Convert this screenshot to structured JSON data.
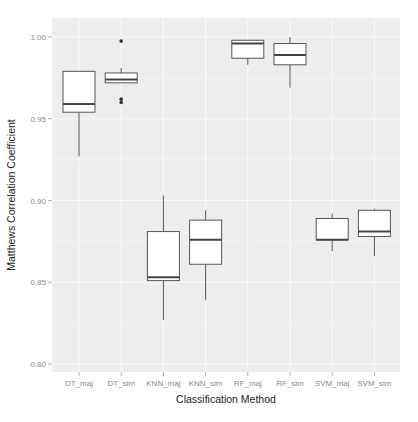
{
  "chart_data": {
    "type": "boxplot",
    "title": "",
    "xlabel": "Classification Method",
    "ylabel": "Matthews Correlation Coefficient",
    "ylim": [
      0.79,
      1.011
    ],
    "yticks": [
      0.8,
      0.85,
      0.9,
      0.95,
      1.0
    ],
    "ytick_labels": [
      "0.80",
      "0.85",
      "0.90",
      "0.95",
      "1.00"
    ],
    "grid": true,
    "legend": null,
    "categories": [
      "DT_maj",
      "DT_sim",
      "KNN_maj",
      "KNN_sim",
      "RF_maj",
      "RF_sim",
      "SVM_maj",
      "SVM_sim"
    ],
    "boxes": [
      {
        "name": "DT_maj",
        "whisker_low": 0.927,
        "q1": 0.954,
        "median": 0.959,
        "q3": 0.979,
        "whisker_high": 0.979,
        "outliers": []
      },
      {
        "name": "DT_sim",
        "whisker_low": 0.972,
        "q1": 0.972,
        "median": 0.974,
        "q3": 0.978,
        "whisker_high": 0.981,
        "outliers": [
          0.9975,
          0.962,
          0.96
        ]
      },
      {
        "name": "KNN_maj",
        "whisker_low": 0.827,
        "q1": 0.851,
        "median": 0.853,
        "q3": 0.881,
        "whisker_high": 0.903,
        "outliers": []
      },
      {
        "name": "KNN_sim",
        "whisker_low": 0.839,
        "q1": 0.861,
        "median": 0.876,
        "q3": 0.888,
        "whisker_high": 0.894,
        "outliers": []
      },
      {
        "name": "RF_maj",
        "whisker_low": 0.983,
        "q1": 0.987,
        "median": 0.996,
        "q3": 0.998,
        "whisker_high": 0.998,
        "outliers": []
      },
      {
        "name": "RF_sim",
        "whisker_low": 0.969,
        "q1": 0.983,
        "median": 0.989,
        "q3": 0.996,
        "whisker_high": 1.0,
        "outliers": []
      },
      {
        "name": "SVM_maj",
        "whisker_low": 0.869,
        "q1": 0.876,
        "median": 0.876,
        "q3": 0.889,
        "whisker_high": 0.892,
        "outliers": []
      },
      {
        "name": "SVM_sim",
        "whisker_low": 0.866,
        "q1": 0.878,
        "median": 0.881,
        "q3": 0.894,
        "whisker_high": 0.895,
        "outliers": []
      }
    ],
    "colors": {
      "panel_background": "#ededed",
      "grid": "#fafafa",
      "box_fill": "#ffffff",
      "box_stroke": "#555555",
      "median": "#444444",
      "tick_text": "#8a8a8a",
      "axis_title": "#222222"
    }
  }
}
